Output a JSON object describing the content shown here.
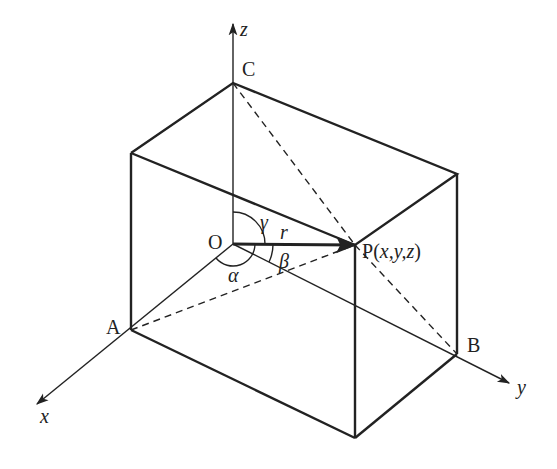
{
  "diagram": {
    "type": "3d-coordinate-box",
    "colors": {
      "stroke": "#222222",
      "background": "#ffffff"
    },
    "axes": {
      "x": {
        "label": "x"
      },
      "y": {
        "label": "y"
      },
      "z": {
        "label": "z"
      }
    },
    "points": {
      "origin": {
        "label": "O"
      },
      "A": {
        "label": "A"
      },
      "B": {
        "label": "B"
      },
      "C": {
        "label": "C"
      },
      "P": {
        "label": "P(x,y,z)"
      }
    },
    "vector": {
      "label": "r"
    },
    "angles": {
      "alpha": {
        "label": "α"
      },
      "beta": {
        "label": "β"
      },
      "gamma": {
        "label": "γ"
      }
    },
    "dashed_segments": [
      "C–P",
      "C–B",
      "A–P"
    ]
  }
}
